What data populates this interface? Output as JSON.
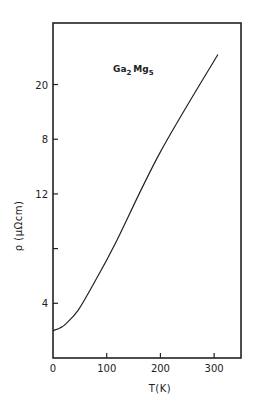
{
  "chart_data": {
    "type": "line",
    "title": "",
    "annotation": {
      "base1": "Ga",
      "sub1": "2",
      "base2": "Mg",
      "sub2": "5"
    },
    "xlabel": "T(K)",
    "ylabel": "ρ (μΩcm)",
    "xlim": [
      0,
      350
    ],
    "ylim": [
      0,
      24.5
    ],
    "x_ticks": [
      {
        "value": 0,
        "label": "0"
      },
      {
        "value": 100,
        "label": "100"
      },
      {
        "value": 200,
        "label": "200"
      },
      {
        "value": 300,
        "label": "300"
      }
    ],
    "y_ticks": [
      {
        "value": 4,
        "label": "4"
      },
      {
        "value": 8,
        "label": ""
      },
      {
        "value": 12,
        "label": "12"
      },
      {
        "value": 16,
        "label": "8"
      },
      {
        "value": 20,
        "label": "20"
      }
    ],
    "grid": false,
    "legend": null,
    "series": [
      {
        "name": "Ga2Mg5",
        "x": [
          0,
          13,
          24,
          47,
          78,
          115,
          199,
          307
        ],
        "y": [
          2.0,
          2.2,
          2.5,
          3.5,
          5.6,
          8.3,
          15.0,
          22.2
        ]
      }
    ]
  },
  "layout": {
    "frame": {
      "left": 53,
      "top": 23,
      "right": 241,
      "bottom": 358
    },
    "line_color": "#222222"
  }
}
